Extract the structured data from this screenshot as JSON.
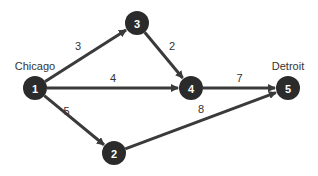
{
  "diagram": {
    "type": "directed-weighted-network",
    "colors": {
      "node": "#2b2b2b",
      "edge": "#3a3a3a",
      "text": "#333333"
    },
    "nodes": [
      {
        "id": "1",
        "label": "1",
        "city": "Chicago"
      },
      {
        "id": "2",
        "label": "2",
        "city": ""
      },
      {
        "id": "3",
        "label": "3",
        "city": ""
      },
      {
        "id": "4",
        "label": "4",
        "city": ""
      },
      {
        "id": "5",
        "label": "5",
        "city": "Detroit"
      }
    ],
    "edges": [
      {
        "from": "1",
        "to": "3",
        "weight": "3"
      },
      {
        "from": "1",
        "to": "4",
        "weight": "4"
      },
      {
        "from": "1",
        "to": "2",
        "weight": "5"
      },
      {
        "from": "3",
        "to": "4",
        "weight": "2"
      },
      {
        "from": "4",
        "to": "5",
        "weight": "7"
      },
      {
        "from": "2",
        "to": "5",
        "weight": "8"
      }
    ]
  }
}
